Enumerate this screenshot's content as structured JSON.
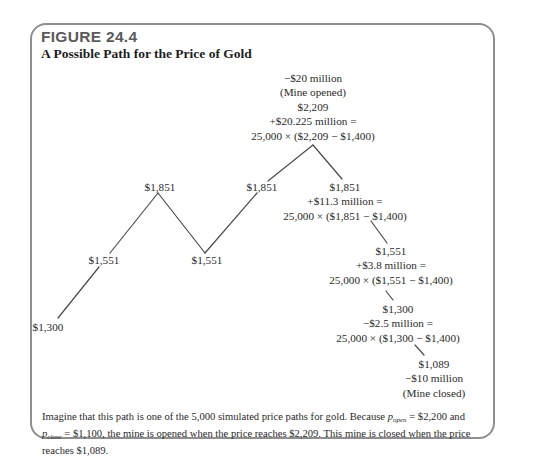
{
  "figure": {
    "number": "FIGURE 24.4",
    "title": "A Possible Path for the Price of Gold"
  },
  "diagram": {
    "type": "price-path",
    "nodes": [
      {
        "id": "n1",
        "price": "$1,300",
        "lines": []
      },
      {
        "id": "n2",
        "price": "$1,551",
        "lines": []
      },
      {
        "id": "n3",
        "price": "$1,851",
        "lines": []
      },
      {
        "id": "n4",
        "price": "$1,551",
        "lines": []
      },
      {
        "id": "n5",
        "price": "$1,851",
        "lines": []
      },
      {
        "id": "n6",
        "price": "$2,209",
        "lines": [
          "−$20 million",
          "(Mine opened)",
          "$2,209",
          "+$20.225 million =",
          "25,000 × ($2,209 − $1,400)"
        ]
      },
      {
        "id": "n7",
        "price": "$1,851",
        "lines": [
          "$1,851",
          "+$11.3 million =",
          "25,000 × ($1,851 − $1,400)"
        ]
      },
      {
        "id": "n8",
        "price": "$1,551",
        "lines": [
          "$1,551",
          "+$3.8 million =",
          "25,000 × ($1,551 − $1,400)"
        ]
      },
      {
        "id": "n9",
        "price": "$1,300",
        "lines": [
          "$1,300",
          "−$2.5 million =",
          "25,000 × ($1,300 − $1,400)"
        ]
      },
      {
        "id": "n10",
        "price": "$1,089",
        "lines": [
          "$1,089",
          "−$10 million",
          "(Mine closed)"
        ]
      }
    ],
    "labels": {
      "n1": "$1,300",
      "n2": "$1,551",
      "n3": "$1,851",
      "n4": "$1,551",
      "n5": "$1,851",
      "n6_l1": "−$20 million",
      "n6_l2": "(Mine opened)",
      "n6_l3": "$2,209",
      "n6_l4": "+$20.225 million =",
      "n6_l5": "25,000 × ($2,209 − $1,400)",
      "n7_l1": "$1,851",
      "n7_l2": "+$11.3 million =",
      "n7_l3": "25,000 × ($1,851 − $1,400)",
      "n8_l1": "$1,551",
      "n8_l2": "+$3.8 million =",
      "n8_l3": "25,000 × ($1,551 − $1,400)",
      "n9_l1": "$1,300",
      "n9_l2": "−$2.5 million =",
      "n9_l3": "25,000 × ($1,300 − $1,400)",
      "n10_l1": "$1,089",
      "n10_l2": "−$10 million",
      "n10_l3": "(Mine closed)"
    },
    "line_color": "#4a4a4a"
  },
  "caption": {
    "part1": "Imagine that this path is one of the 5,000 simulated price paths for gold. Because ",
    "p_open_var": "p",
    "p_open_sub": "open",
    "part2": " = $2,200 and ",
    "p_close_var": "p",
    "p_close_sub": "close",
    "part3": " = $1,100, the mine is opened when the price reaches $2,209. This mine is closed when the price reaches $1,089."
  },
  "colors": {
    "border": "#8e8e8e",
    "figure_number": "#5a5a5a",
    "text": "#2a2a2a"
  }
}
